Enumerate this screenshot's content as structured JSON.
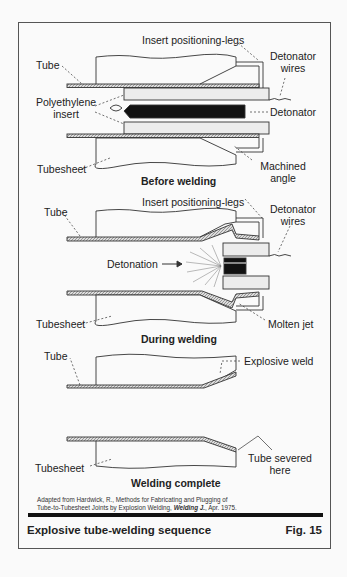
{
  "figure": {
    "title": "Explosive tube-welding sequence",
    "number": "Fig. 15",
    "credit_line1": "Adapted from Hardwick, R.,  Methods for Fabricating and Plugging of",
    "credit_line2a": "Tube-to-Tubesheet Joints by Explosion Welding, ",
    "credit_journal": "Welding J.",
    "credit_line2b": ", Apr. 1975."
  },
  "stages": [
    {
      "caption": "Before welding",
      "labels": {
        "tube": "Tube",
        "insert_legs": "Insert positioning-legs",
        "det_wires_1": "Detonator",
        "det_wires_2": "wires",
        "poly_1": "Polyethylene",
        "poly_2": "insert",
        "detonator": "Detonator",
        "tubesheet": "Tubesheet",
        "machined_1": "Machined",
        "machined_2": "angle"
      }
    },
    {
      "caption": "During welding",
      "labels": {
        "tube": "Tube",
        "insert_legs": "Insert positioning-legs",
        "det_wires_1": "Detonator",
        "det_wires_2": "wires",
        "detonation": "Detonation",
        "tubesheet": "Tubesheet",
        "molten_jet": "Molten jet"
      }
    },
    {
      "caption": "Welding complete",
      "labels": {
        "tube": "Tube",
        "explosive_weld": "Explosive weld",
        "tubesheet": "Tubesheet",
        "severed_1": "Tube severed",
        "severed_2": "here"
      }
    }
  ]
}
